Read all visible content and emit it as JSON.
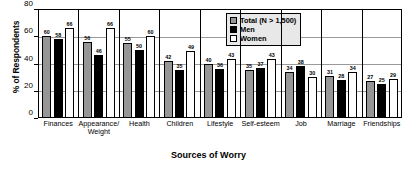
{
  "chart_data": {
    "type": "bar",
    "title": "",
    "xlabel": "Sources of Worry",
    "ylabel": "% of Respondents",
    "ylim": [
      0,
      80
    ],
    "yticks": [
      0,
      20,
      40,
      60,
      80
    ],
    "grid": true,
    "legend_position": "top-right",
    "categories": [
      "Finances",
      "Appearance/\nWeight",
      "Health",
      "Children",
      "Lifestyle",
      "Self-esteem",
      "Job",
      "Marriage",
      "Friendships"
    ],
    "series": [
      {
        "name": "Total (N > 1,500)",
        "color": "#969696",
        "values": [
          60,
          56,
          55,
          42,
          40,
          35,
          34,
          31,
          27
        ]
      },
      {
        "name": "Men",
        "color": "#000000",
        "values": [
          58,
          46,
          50,
          35,
          36,
          37,
          38,
          28,
          25
        ]
      },
      {
        "name": "Women",
        "color": "#ffffff",
        "values": [
          66,
          66,
          60,
          49,
          43,
          43,
          30,
          34,
          29
        ]
      }
    ]
  },
  "legend": {
    "items": [
      {
        "label": "Total (N > 1,500)",
        "key": "total"
      },
      {
        "label": "Men",
        "key": "men"
      },
      {
        "label": "Women",
        "key": "women"
      }
    ]
  }
}
